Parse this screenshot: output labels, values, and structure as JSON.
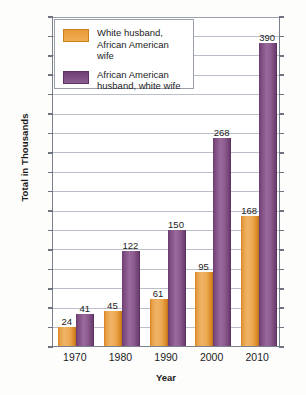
{
  "chart_data": {
    "type": "bar",
    "title": "",
    "xlabel": "Year",
    "ylabel": "Total in Thousands",
    "categories": [
      "1970",
      "1980",
      "1990",
      "2000",
      "2010"
    ],
    "ylim": [
      0,
      425
    ],
    "ytick_step": 25,
    "yticks": [
      "0",
      "25",
      "50",
      "75",
      "100",
      "125",
      "150",
      "175",
      "200",
      "225",
      "250",
      "275",
      "300",
      "325",
      "350",
      "375",
      "400",
      "425"
    ],
    "grid": true,
    "legend_position": "top-left",
    "series": [
      {
        "name": "White husband, African American wife",
        "name_line1": "White husband,",
        "name_line2": "African American wife",
        "color": "#eba84f",
        "values": [
          24,
          45,
          61,
          95,
          168
        ]
      },
      {
        "name": "African American husband, white wife",
        "name_line1": "African American",
        "name_line2": "husband, white wife",
        "color": "#8a5a8c",
        "values": [
          41,
          122,
          150,
          268,
          390
        ]
      }
    ]
  },
  "colors": {
    "orange": "#eba84f",
    "purple": "#8a5a8c",
    "axis": "#7a7f8c",
    "gridline": "#b9bec8",
    "text": "#1c1c1c"
  }
}
